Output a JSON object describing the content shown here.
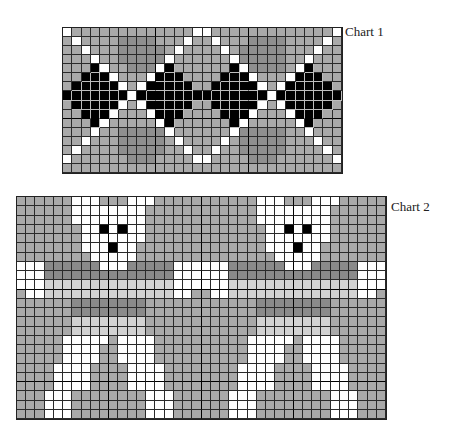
{
  "charts": [
    {
      "id": "chart1",
      "label": "Chart 1",
      "cols": 30,
      "rows": 16,
      "legend": {
        "W": "white",
        "G": "medium gray",
        "M": "darker gray (diamond field)",
        "B": "black (diamond)"
      },
      "grid": [
        "WGGGGGGGGGGGGGWWGGGGGGGGGGGGGW",
        "GWGGGGMMMMGGGWGGWGGGMMMMGGGGWG",
        "GGWGGGMMMMMGWGGGGWGMMMMMGGGWGG",
        "GGGWGGMMMMMWGGGGGGWMMMMMGGWGGG",
        "GGGBWGGMMMWBGGGGGGBWMMMMGWBGGG",
        "GGBBBWGGGWBBBGGGGBBBWGGGWBBBGG",
        "GBBBBBWGWBBBBBGGBBBBBWGWBBBBBG",
        "BBBBBBBWBBBBBBBBBBBBBBWBBBBBBB",
        "GBBBBBWGWBBBBBGGBBBBBWGWBBBBBG",
        "GGBBBWGGGWBBBGGGGBBBWGGGWBBBGG",
        "GGGBWGGGGGWBGGGGGGBWGGGGGWBGGG",
        "GGGWGGMMMMMWGGGGGGWMMMMMGGWGGG",
        "GGWGGGMMMMMGWGGGGWGMMMMMGGGWGG",
        "GWGGGGMMMMMGGWGGWGGMMMMMGGGGWG",
        "WGGGGGGMMMGGGGWWGGGGMMMGGGGGGW",
        "GGGGGGGGGGGGGGGGGGGGGGGGGGGGGG"
      ]
    },
    {
      "id": "chart2",
      "label": "Chart 2",
      "cols": 40,
      "rows": 24,
      "repeat_width": 20,
      "legend": {
        "W": "white",
        "G": "medium gray",
        "D": "dark gray",
        "L": "light gray",
        "K": "black"
      },
      "grid": [
        "GGGGGGWWWGGGWWWGGGGG",
        "GGGGGGWWWWWWWWGGGGGG",
        "GGGGGGWWWWWWWWGGGGGG",
        "GGGGGGGWWKWKWWGGGGGG",
        "GGGGGGGWWWWWWWGGGGGG",
        "GGGGGGGWWWKWWGGGGGGG",
        "GGGGGGGGWWWWWGGGGGGG",
        "WWWDDDDDDWWWDDDDDWWW",
        "WWWDDDDDDDDDDDDDDWWW",
        "WWWLLLLLLLLLLLLLLWWW",
        "GWWLLLLLLLLLLLLLLWWG",
        "GGGGGGDDDDDDDDGGGGGG",
        "GGGGGGDDDDDDDDGGGGGG",
        "GGGGGGLLLLLLLLGGGGGG",
        "GGGGGGLLLLLLLLGGGGGG",
        "GGGGGWWWWWGWWWWGGGGG",
        "GGGGGWWWWGGWWWWGGGGG",
        "GGGGGWWWWGGWWWWGGGGG",
        "GGGGWWWWGGGGWWWWGGGG",
        "GGGGWWWWGGGGWWWWGGGG",
        "GGGGWWWWGGGGWWWWGGGG",
        "GGGWWWGGGGGGGGWWWGGG",
        "GGGWWWGGGGGGGGWWWGGG",
        "GGGWWWGGGGGGGGWWWGGG"
      ]
    }
  ]
}
